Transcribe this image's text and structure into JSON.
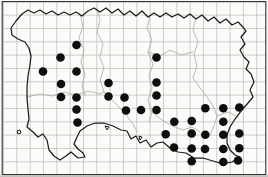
{
  "figure": {
    "kind": "species-distribution-grid-map",
    "island": "jersey-outline",
    "width": 268,
    "height": 177,
    "colors": {
      "paper": "#fbfbf9",
      "grid": "#b9b9b6",
      "frame": "#2e2e2c",
      "coast": "#1d1d1b",
      "boundary": "#9d9d99",
      "dot": "#0e0e0c",
      "scan_edge": "#c2c2be"
    },
    "grid": {
      "pitch": 13.33,
      "x0": 3.5,
      "y0": 1.8,
      "v_lines": 20,
      "h_lines": 14,
      "frame": {
        "x": 2.2,
        "y": 1.6,
        "w": 263.6,
        "h": 173.0
      }
    },
    "dot_radius": 4.3
  },
  "chart_data": {
    "type": "scatter",
    "title": "",
    "xlabel": "",
    "ylabel": "",
    "legend": "filled circle = occupied grid square",
    "occupied_square_count": 37,
    "points_px": [
      [
        76.5,
        45
      ],
      [
        60.5,
        57.5
      ],
      [
        156.5,
        57.5
      ],
      [
        43,
        71.5
      ],
      [
        76.5,
        71.5
      ],
      [
        61,
        84
      ],
      [
        108.5,
        83
      ],
      [
        156.5,
        82.5
      ],
      [
        61,
        97
      ],
      [
        76.5,
        97.5
      ],
      [
        108.5,
        96.5
      ],
      [
        124.5,
        97.5
      ],
      [
        156.5,
        95.5
      ],
      [
        76.5,
        109.5
      ],
      [
        126,
        110.5
      ],
      [
        141,
        110
      ],
      [
        156.5,
        110
      ],
      [
        205.3,
        108.3
      ],
      [
        223.3,
        108.3
      ],
      [
        239.3,
        107.5
      ],
      [
        77.5,
        122.5
      ],
      [
        174.3,
        121.7
      ],
      [
        191.7,
        121
      ],
      [
        223.3,
        121.7
      ],
      [
        165.7,
        134.3
      ],
      [
        191.7,
        133.5
      ],
      [
        205.3,
        134.7
      ],
      [
        223.3,
        134.7
      ],
      [
        239.3,
        133.5
      ],
      [
        174,
        147.5
      ],
      [
        191.7,
        148.5
      ],
      [
        205,
        149
      ],
      [
        223.3,
        149
      ],
      [
        239.3,
        148.3
      ],
      [
        191.7,
        161.3
      ],
      [
        223.3,
        162
      ],
      [
        238,
        160.5
      ]
    ]
  },
  "map": {
    "coastline": [
      [
        11,
        28
      ],
      [
        16,
        21
      ],
      [
        22,
        14
      ],
      [
        28,
        10
      ],
      [
        34,
        13
      ],
      [
        40,
        10
      ],
      [
        46,
        14
      ],
      [
        52,
        11
      ],
      [
        58,
        15
      ],
      [
        64,
        12
      ],
      [
        70,
        15
      ],
      [
        76,
        12
      ],
      [
        82,
        16
      ],
      [
        88,
        11
      ],
      [
        94,
        8
      ],
      [
        100,
        12
      ],
      [
        106,
        8
      ],
      [
        112,
        13
      ],
      [
        118,
        9
      ],
      [
        124,
        15
      ],
      [
        130,
        11
      ],
      [
        136,
        16
      ],
      [
        142,
        11
      ],
      [
        148,
        17
      ],
      [
        154,
        13
      ],
      [
        160,
        17
      ],
      [
        166,
        13
      ],
      [
        172,
        17
      ],
      [
        178,
        14
      ],
      [
        184,
        18
      ],
      [
        190,
        14
      ],
      [
        196,
        19
      ],
      [
        202,
        15
      ],
      [
        208,
        21
      ],
      [
        214,
        17
      ],
      [
        220,
        23
      ],
      [
        226,
        19
      ],
      [
        232,
        25
      ],
      [
        238,
        22
      ],
      [
        243,
        27
      ],
      [
        246,
        31
      ],
      [
        241,
        37
      ],
      [
        245,
        44
      ],
      [
        240,
        50
      ],
      [
        244,
        57
      ],
      [
        249,
        62
      ],
      [
        246,
        69
      ],
      [
        251,
        74
      ],
      [
        254,
        82
      ],
      [
        250,
        90
      ],
      [
        253,
        97
      ],
      [
        248,
        103
      ],
      [
        241,
        111
      ],
      [
        235,
        119
      ],
      [
        230,
        127
      ],
      [
        227,
        135
      ],
      [
        227,
        143
      ],
      [
        230,
        150
      ],
      [
        235,
        155
      ],
      [
        240,
        157
      ],
      [
        232,
        162
      ],
      [
        223,
        164
      ],
      [
        213,
        161
      ],
      [
        203,
        158
      ],
      [
        194,
        158
      ],
      [
        186,
        153
      ],
      [
        178,
        152
      ],
      [
        170,
        148
      ],
      [
        163,
        142
      ],
      [
        157,
        143
      ],
      [
        151,
        147
      ],
      [
        146,
        140
      ],
      [
        140,
        143
      ],
      [
        136,
        136
      ],
      [
        131,
        139
      ],
      [
        127,
        131
      ],
      [
        121,
        130
      ],
      [
        113,
        126
      ],
      [
        104,
        123
      ],
      [
        95,
        123
      ],
      [
        87,
        126
      ],
      [
        80,
        131
      ],
      [
        77,
        137
      ],
      [
        74,
        144
      ],
      [
        78,
        149
      ],
      [
        83,
        153
      ],
      [
        85,
        157
      ],
      [
        78,
        158
      ],
      [
        71,
        152
      ],
      [
        66,
        156
      ],
      [
        60,
        160
      ],
      [
        54,
        156
      ],
      [
        49,
        150
      ],
      [
        47,
        140
      ],
      [
        43,
        134
      ],
      [
        38,
        137
      ],
      [
        33,
        132
      ],
      [
        27,
        127
      ],
      [
        29,
        119
      ],
      [
        28,
        109
      ],
      [
        27,
        98
      ],
      [
        27,
        87
      ],
      [
        28,
        76
      ],
      [
        30,
        65
      ],
      [
        31,
        56
      ],
      [
        29,
        48
      ],
      [
        25,
        42
      ],
      [
        18,
        39
      ],
      [
        12,
        35
      ]
    ],
    "islets": [
      [
        [
          17,
          131
        ],
        [
          20,
          130
        ],
        [
          21,
          133
        ],
        [
          18,
          134
        ],
        [
          17,
          131
        ]
      ],
      [
        [
          105,
          126
        ],
        [
          109,
          127
        ],
        [
          107,
          130
        ],
        [
          105,
          126
        ]
      ],
      [
        [
          139,
          136
        ],
        [
          142,
          137
        ],
        [
          140,
          140
        ],
        [
          139,
          136
        ]
      ]
    ],
    "parish_boundaries": [
      [
        [
          97,
          8
        ],
        [
          100,
          20
        ],
        [
          97,
          32
        ],
        [
          103,
          44
        ],
        [
          100,
          57
        ],
        [
          104,
          68
        ],
        [
          100,
          80
        ],
        [
          104,
          92
        ]
      ],
      [
        [
          80,
          14
        ],
        [
          83,
          26
        ],
        [
          79,
          38
        ],
        [
          84,
          50
        ],
        [
          81,
          62
        ],
        [
          85,
          74
        ],
        [
          82,
          86
        ],
        [
          85,
          95
        ]
      ],
      [
        [
          150,
          16
        ],
        [
          147,
          28
        ],
        [
          152,
          40
        ],
        [
          148,
          52
        ],
        [
          153,
          64
        ],
        [
          149,
          76
        ],
        [
          152,
          88
        ],
        [
          148,
          100
        ],
        [
          152,
          112
        ],
        [
          149,
          122
        ]
      ],
      [
        [
          196,
          18
        ],
        [
          193,
          30
        ],
        [
          198,
          42
        ],
        [
          194,
          54
        ],
        [
          197,
          66
        ],
        [
          193,
          78
        ]
      ],
      [
        [
          27,
          97
        ],
        [
          40,
          94
        ],
        [
          52,
          96
        ],
        [
          64,
          92
        ],
        [
          76,
          95
        ],
        [
          88,
          91
        ],
        [
          100,
          94
        ],
        [
          104,
          92
        ]
      ],
      [
        [
          104,
          92
        ],
        [
          112,
          100
        ],
        [
          120,
          108
        ],
        [
          127,
          116
        ],
        [
          133,
          124
        ],
        [
          137,
          132
        ]
      ],
      [
        [
          148,
          52
        ],
        [
          160,
          56
        ],
        [
          170,
          50
        ],
        [
          181,
          55
        ],
        [
          193,
          52
        ]
      ],
      [
        [
          193,
          78
        ],
        [
          200,
          88
        ],
        [
          207,
          97
        ],
        [
          213,
          106
        ],
        [
          217,
          116
        ],
        [
          214,
          126
        ],
        [
          210,
          135
        ]
      ],
      [
        [
          217,
          116
        ],
        [
          228,
          112
        ],
        [
          238,
          117
        ]
      ],
      [
        [
          152,
          112
        ],
        [
          162,
          120
        ],
        [
          172,
          126
        ],
        [
          183,
          130
        ],
        [
          192,
          127
        ],
        [
          200,
          132
        ]
      ]
    ]
  }
}
